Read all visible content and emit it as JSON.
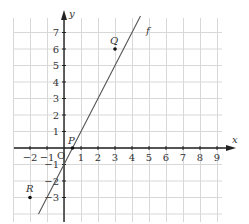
{
  "figure": {
    "x_axis_label": "x",
    "y_axis_label": "y",
    "origin_label": "O",
    "x_ticks": [
      "−2",
      "−1",
      "1",
      "2",
      "3",
      "4",
      "5",
      "6",
      "7",
      "8",
      "9"
    ],
    "y_ticks": [
      "7",
      "6",
      "5",
      "4",
      "3",
      "2",
      "1",
      "−1",
      "−2",
      "−3"
    ],
    "line": {
      "label": "f",
      "equation": "y = 2x − 1",
      "color": "#555555"
    },
    "points": [
      {
        "label": "Q",
        "x": 3,
        "y": 6
      },
      {
        "label": "P",
        "x": 0.5,
        "y": 0
      },
      {
        "label": "R",
        "x": -2,
        "y": -3
      }
    ],
    "grid_color": "#d8d8d8",
    "axis_color": "#222222"
  }
}
